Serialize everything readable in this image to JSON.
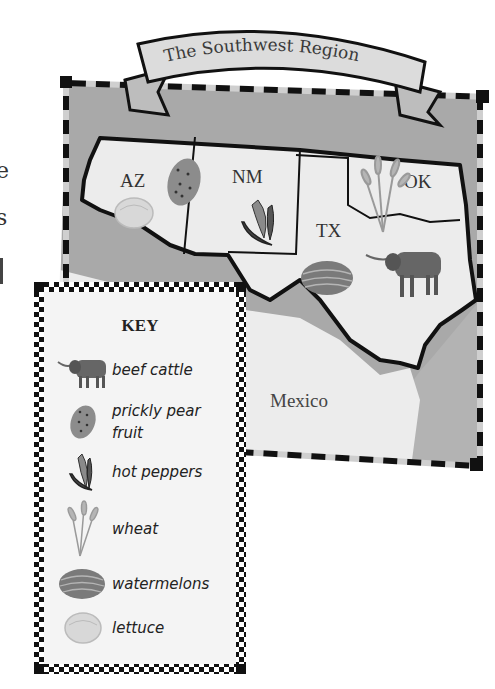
{
  "title": "The Southwest Region",
  "edge_fragments": [
    "e",
    "s"
  ],
  "states": [
    {
      "abbr": "AZ",
      "product": "lettuce"
    },
    {
      "abbr": "NM",
      "product": "hot peppers"
    },
    {
      "abbr": "TX",
      "product": "beef cattle, watermelons"
    },
    {
      "abbr": "OK",
      "product": "wheat"
    }
  ],
  "labels": {
    "az": "AZ",
    "nm": "NM",
    "tx": "TX",
    "ok": "OK",
    "mexico": "Mexico"
  },
  "key": {
    "title": "KEY",
    "items": [
      {
        "icon": "cattle-icon",
        "label": "beef cattle"
      },
      {
        "icon": "prickly-pear-icon",
        "label": "prickly pear fruit"
      },
      {
        "icon": "hot-pepper-icon",
        "label": "hot peppers"
      },
      {
        "icon": "wheat-icon",
        "label": "wheat"
      },
      {
        "icon": "watermelon-icon",
        "label": "watermelons"
      },
      {
        "icon": "lettuce-icon",
        "label": "lettuce"
      }
    ]
  },
  "colors": {
    "land": "#ececec",
    "background_gray": "#a9a9a9",
    "border": "#111111",
    "banner": "#dcdcdc",
    "icon_gray": "#7a7a7a"
  }
}
